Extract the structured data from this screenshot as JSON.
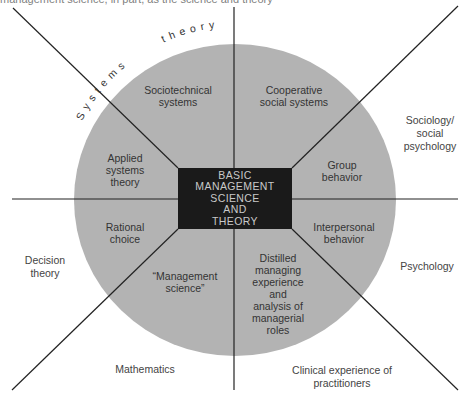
{
  "caption": "management science, in part, as the science and theory",
  "center": {
    "label": "BASIC\nMANAGEMENT\nSCIENCE\nAND\nTHEORY",
    "fill": "#1a1a1a",
    "text_color": "#c9c9c9"
  },
  "circle": {
    "fill": "#b3b3b3"
  },
  "arc_labels": {
    "systems": "S y s t e m s",
    "theory": "t h e o r y"
  },
  "inner_sectors": [
    {
      "id": "sociotechnical",
      "label": "Sociotechnical\nsystems"
    },
    {
      "id": "cooperative",
      "label": "Cooperative\nsocial systems"
    },
    {
      "id": "group",
      "label": "Group\nbehavior"
    },
    {
      "id": "interpersonal",
      "label": "Interpersonal\nbehavior"
    },
    {
      "id": "distilled",
      "label": "Distilled\nmanaging\nexperience\nand\nanalysis of\nmanagerial\nroles"
    },
    {
      "id": "management-science",
      "label": "“Management\nscience”"
    },
    {
      "id": "rational",
      "label": "Rational\nchoice"
    },
    {
      "id": "applied",
      "label": "Applied\nsystems\ntheory"
    }
  ],
  "outer_disciplines": [
    {
      "id": "sociology",
      "label": "Sociology/\nsocial\npsychology"
    },
    {
      "id": "psychology",
      "label": "Psychology"
    },
    {
      "id": "clinical",
      "label": "Clinical experience of\npractitioners"
    },
    {
      "id": "mathematics",
      "label": "Mathematics"
    },
    {
      "id": "decision",
      "label": "Decision\ntheory"
    }
  ]
}
